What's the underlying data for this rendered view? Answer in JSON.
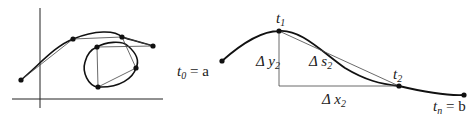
{
  "left_figure": {
    "description": "Polygonal approximation of a curve and a closed loop on coordinate axes",
    "points_curve": [
      [
        21,
        80
      ],
      [
        73,
        39
      ],
      [
        122,
        37
      ],
      [
        153,
        46
      ]
    ],
    "points_loop": [
      [
        97,
        47
      ],
      [
        136,
        68
      ],
      [
        98,
        87
      ]
    ]
  },
  "right_figure": {
    "labels": {
      "t0": "t",
      "t0_sub": "0",
      "t0_eq": " = a",
      "t1": "t",
      "t1_sub": "1",
      "t2": "t",
      "t2_sub": "2",
      "tn": "t",
      "tn_sub": "n",
      "tn_eq": " = b",
      "dy": "Δ y",
      "dy_sub": "2",
      "ds": "Δ s",
      "ds_sub": "2",
      "dx": "Δ x",
      "dx_sub": "2"
    }
  }
}
